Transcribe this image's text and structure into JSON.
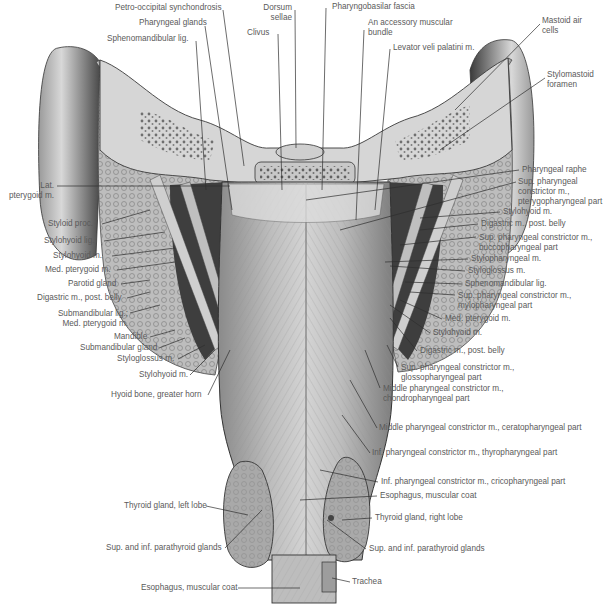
{
  "figure": {
    "view": "Pharynx, posterior view",
    "colors": {
      "background": "#ffffff",
      "text": "#5a5a5a",
      "leader": "#333333",
      "tissue_light": "#d9d9d9",
      "tissue_mid": "#a6a6a6",
      "tissue_dark": "#4a4a4a"
    }
  },
  "labels_top": [
    {
      "id": "petro-occipital-synchondrosis",
      "text": "Petro-occipital synchondrosis",
      "x": 115,
      "y": 7
    },
    {
      "id": "pharyngeal-glands",
      "text": "Pharyngeal glands",
      "x": 139,
      "y": 22
    },
    {
      "id": "sphenomandibular-lig-top",
      "text": "Sphenomandibular lig.",
      "x": 107,
      "y": 37
    },
    {
      "id": "dorsum-sellae",
      "text": "Dorsum\nsellae",
      "x": 262,
      "y": 7
    },
    {
      "id": "clivus",
      "text": "Clivus",
      "x": 247,
      "y": 31
    },
    {
      "id": "pharyngobasilar-fascia",
      "text": "Pharyngobasilar fascia",
      "x": 332,
      "y": 5
    },
    {
      "id": "accessory-muscular-bundle",
      "text": "An accessory muscular\nbundle",
      "x": 368,
      "y": 21
    },
    {
      "id": "levator-veli-palatini",
      "text": "Levator veli palatini m.",
      "x": 393,
      "y": 45
    },
    {
      "id": "mastoid-air-cells",
      "text": "Mastoid air\ncells",
      "x": 542,
      "y": 18
    },
    {
      "id": "stylomastoid-foramen",
      "text": "Stylomastoid\nforamen",
      "x": 547,
      "y": 73
    }
  ],
  "labels_left": [
    {
      "id": "lat-pterygoid",
      "text": "Lat.\npterygoid m.",
      "x": 8,
      "y": 183,
      "right": true,
      "w": 46
    },
    {
      "id": "styloid-proc",
      "text": "Styloid proc.",
      "x": 48,
      "y": 221
    },
    {
      "id": "stylohyoid-lig",
      "text": "Stylohyoid lig.",
      "x": 44,
      "y": 238
    },
    {
      "id": "stylohyoid-m-left",
      "text": "Stylohyoid m.",
      "x": 53,
      "y": 253
    },
    {
      "id": "med-pterygoid-left",
      "text": "Med. pterygoid m.",
      "x": 45,
      "y": 267
    },
    {
      "id": "parotid-gland",
      "text": "Parotid gland",
      "x": 68,
      "y": 281
    },
    {
      "id": "digastric-left",
      "text": "Digastric m., post. belly",
      "x": 37,
      "y": 295
    },
    {
      "id": "submandibular-lig",
      "text": "Submandibular lig.;\nMed. pterygoid m.",
      "x": 60,
      "y": 310,
      "right": true,
      "w": 68
    },
    {
      "id": "mandible",
      "text": "Mandible",
      "x": 114,
      "y": 334
    },
    {
      "id": "submandibular-gland",
      "text": "Submandibular gland",
      "x": 80,
      "y": 345
    },
    {
      "id": "styloglossus-left",
      "text": "Styloglossus m.",
      "x": 117,
      "y": 356
    },
    {
      "id": "stylohyoid-m-left2",
      "text": "Stylohyoid m.",
      "x": 139,
      "y": 372
    },
    {
      "id": "hyoid-bone",
      "text": "Hyoid bone, greater horn",
      "x": 111,
      "y": 392
    },
    {
      "id": "thyroid-left",
      "text": "Thyroid gland, left lobe",
      "x": 124,
      "y": 503
    },
    {
      "id": "parathyroid-left",
      "text": "Sup. and inf. parathyroid glands",
      "x": 106,
      "y": 545
    },
    {
      "id": "esophagus-bottom",
      "text": "Esophagus, muscular coat",
      "x": 141,
      "y": 585
    }
  ],
  "labels_right": [
    {
      "id": "pharyngeal-raphe",
      "text": "Pharyngeal raphe",
      "x": 522,
      "y": 166
    },
    {
      "id": "sup-constrictor-pterygo",
      "text": "Sup. pharyngeal\nconstrictor m.,\npterygopharyngeal part",
      "x": 518,
      "y": 178
    },
    {
      "id": "stylohyoid-right",
      "text": "Stylohyoid m.",
      "x": 503,
      "y": 209
    },
    {
      "id": "digastric-right",
      "text": "Digastric m., post. belly",
      "x": 481,
      "y": 221
    },
    {
      "id": "sup-constrictor-bucco",
      "text": "Sup. pharyngeal constrictor m.,\nbuccopharyngeal part",
      "x": 479,
      "y": 234
    },
    {
      "id": "stylopharyngeal",
      "text": "Stylopharyngeal m.",
      "x": 471,
      "y": 256
    },
    {
      "id": "styloglossus-right",
      "text": "Styloglossus m.",
      "x": 468,
      "y": 268
    },
    {
      "id": "sphenomandibular-right",
      "text": "Sphenomandibular lig.",
      "x": 465,
      "y": 281
    },
    {
      "id": "sup-constrictor-mylo",
      "text": "Sup. pharyngeal constrictor m.,\nmylopharyngeal part",
      "x": 458,
      "y": 292
    },
    {
      "id": "med-pterygoid-right",
      "text": "Med. pterygoid m.",
      "x": 445,
      "y": 316
    },
    {
      "id": "stylohyoid-right2",
      "text": "Stylohyoid m.",
      "x": 433,
      "y": 330
    },
    {
      "id": "digastric-right2",
      "text": "Digastric m., post. belly",
      "x": 420,
      "y": 348
    },
    {
      "id": "sup-constrictor-glosso",
      "text": "Sup. pharyngeal constrictor m.,\nglossopharyngeal part",
      "x": 401,
      "y": 365
    },
    {
      "id": "middle-constrictor-chondro",
      "text": "Middle pharyngeal constrictor m.,\nchondropharyngeal part",
      "x": 383,
      "y": 385
    },
    {
      "id": "middle-constrictor-cerato",
      "text": "Middle pharyngeal constrictor m., ceratopharyngeal part",
      "x": 379,
      "y": 425
    },
    {
      "id": "inf-constrictor-thyro",
      "text": "Inf. pharyngeal constrictor m., thyropharyngeal part",
      "x": 372,
      "y": 450
    },
    {
      "id": "inf-constrictor-crico",
      "text": "Inf. pharyngeal constrictor m., cricopharyngeal part",
      "x": 381,
      "y": 479
    },
    {
      "id": "esophagus-right",
      "text": "Esophagus, muscular coat",
      "x": 380,
      "y": 493
    },
    {
      "id": "thyroid-right",
      "text": "Thyroid gland, right lobe",
      "x": 375,
      "y": 515
    },
    {
      "id": "parathyroid-right",
      "text": "Sup. and inf. parathyroid glands",
      "x": 369,
      "y": 546
    },
    {
      "id": "trachea",
      "text": "Trachea",
      "x": 352,
      "y": 579
    }
  ]
}
